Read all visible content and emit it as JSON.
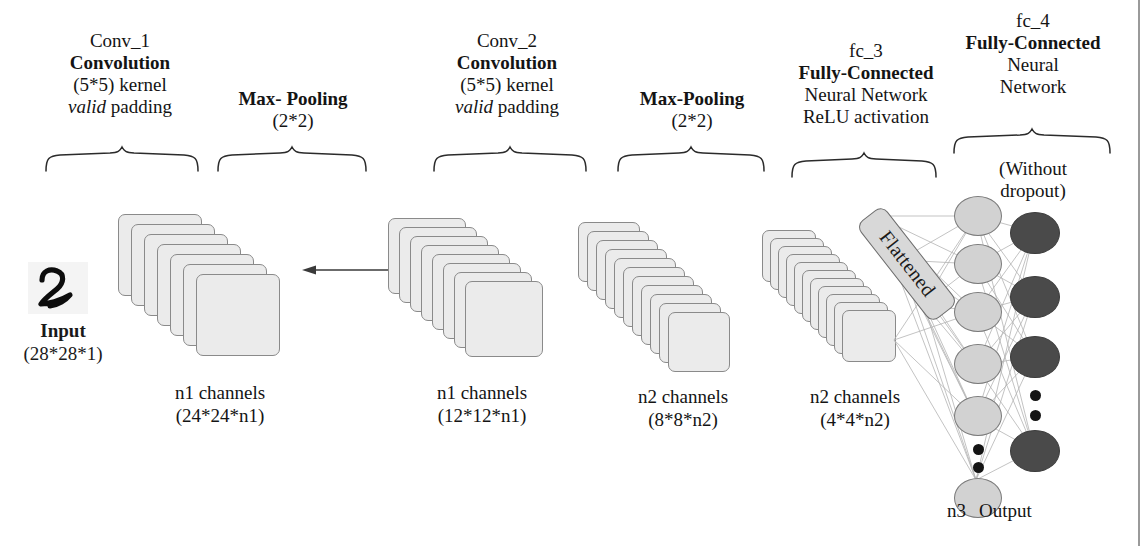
{
  "figure": {
    "colors": {
      "card_fill": "#ebebeb",
      "card_border": "#8a8a8a",
      "hidden_neuron_fill": "#d2d2d2",
      "output_neuron_fill": "#4a4a4a",
      "flatten_tag_fill": "#d8d8d8",
      "connection_line": "#b0b0b0",
      "text": "#141414",
      "background": "#ffffff"
    }
  },
  "stages": [
    {
      "id": "conv_1",
      "lines": [
        {
          "text": "Conv_1",
          "style": "normal"
        },
        {
          "text": "Convolution",
          "style": "bold"
        },
        {
          "text": "(5*5) kernel",
          "style": "normal"
        },
        {
          "text": "valid padding",
          "style": "italic-first"
        }
      ]
    },
    {
      "id": "maxpool_1",
      "lines": [
        {
          "text": "Max- Pooling",
          "style": "bold"
        },
        {
          "text": "(2*2)",
          "style": "normal"
        }
      ]
    },
    {
      "id": "conv_2",
      "lines": [
        {
          "text": "Conv_2",
          "style": "normal"
        },
        {
          "text": "Convolution",
          "style": "bold"
        },
        {
          "text": "(5*5) kernel",
          "style": "normal"
        },
        {
          "text": "valid padding",
          "style": "italic-first"
        }
      ]
    },
    {
      "id": "maxpool_2",
      "lines": [
        {
          "text": "Max-Pooling",
          "style": "bold"
        },
        {
          "text": "(2*2)",
          "style": "normal"
        }
      ]
    },
    {
      "id": "fc_3",
      "lines": [
        {
          "text": "fc_3",
          "style": "normal"
        },
        {
          "text": "Fully-Connected",
          "style": "bold"
        },
        {
          "text": "Neural Network",
          "style": "normal"
        },
        {
          "text": "ReLU activation",
          "style": "normal"
        }
      ]
    },
    {
      "id": "fc_4",
      "lines": [
        {
          "text": "fc_4",
          "style": "normal"
        },
        {
          "text": "Fully-Connected",
          "style": "bold"
        },
        {
          "text": "Neural",
          "style": "normal"
        },
        {
          "text": "Network",
          "style": "normal"
        }
      ]
    }
  ],
  "stage_labels": {
    "conv1_l1": "Conv_1",
    "conv1_l2": "Convolution",
    "conv1_l3": "(5*5) kernel",
    "conv1_l4_em": "valid",
    "conv1_l4_rest": " padding",
    "pool1_l1": "Max- Pooling",
    "pool1_l2": "(2*2)",
    "conv2_l1": "Conv_2",
    "conv2_l2": "Convolution",
    "conv2_l3": "(5*5) kernel",
    "conv2_l4_em": "valid",
    "conv2_l4_rest": " padding",
    "pool2_l1": "Max-Pooling",
    "pool2_l2": "(2*2)",
    "fc3_l1": "fc_3",
    "fc3_l2": "Fully-Connected",
    "fc3_l3": "Neural Network",
    "fc3_l4": "ReLU activation",
    "fc4_l1": "fc_4",
    "fc4_l2": "Fully-Connected",
    "fc4_l3": "Neural",
    "fc4_l4": "Network",
    "fc4_note_l1": "(Without",
    "fc4_note_l2": "dropout)"
  },
  "input": {
    "digit": "2",
    "label": "Input",
    "dimensions": "(28*28*1)"
  },
  "feature_maps": [
    {
      "id": "conv1_out",
      "channels_label": "n1 channels",
      "shape_label": "(24*24*n1)",
      "card_count": 7
    },
    {
      "id": "pool1_out",
      "channels_label": "n1 channels",
      "shape_label": "(12*12*n1)",
      "card_count": 8
    },
    {
      "id": "conv2_out",
      "channels_label": "n2 channels",
      "shape_label": "(8*8*n2)",
      "card_count": 11
    },
    {
      "id": "pool2_out",
      "channels_label": "n2 channels",
      "shape_label": "(4*4*n2)",
      "card_count": 11
    }
  ],
  "flatten": {
    "label": "Flattened"
  },
  "output_layer": {
    "neuron_count_label": "n3",
    "label": "Output"
  }
}
